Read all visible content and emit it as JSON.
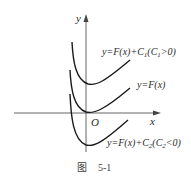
{
  "figure": {
    "caption_prefix": "图",
    "caption_number": "5-1",
    "axes": {
      "x_label": "x",
      "y_label": "y",
      "origin_label": "O"
    },
    "curves": [
      {
        "id": "upper",
        "label_main": "y=F(x)+C",
        "sub1": "1",
        "label_mid": "(C",
        "sub2": "1",
        "label_end": ">0)"
      },
      {
        "id": "middle",
        "label": "y=F(x)"
      },
      {
        "id": "lower",
        "label_main": "y=F(x)+C",
        "sub1": "2",
        "label_mid": "(C",
        "sub2": "2",
        "label_end": "<0)"
      }
    ],
    "colors": {
      "axis": "#555555",
      "curve": "#1a1a1a",
      "text": "#2a2a2a"
    }
  }
}
